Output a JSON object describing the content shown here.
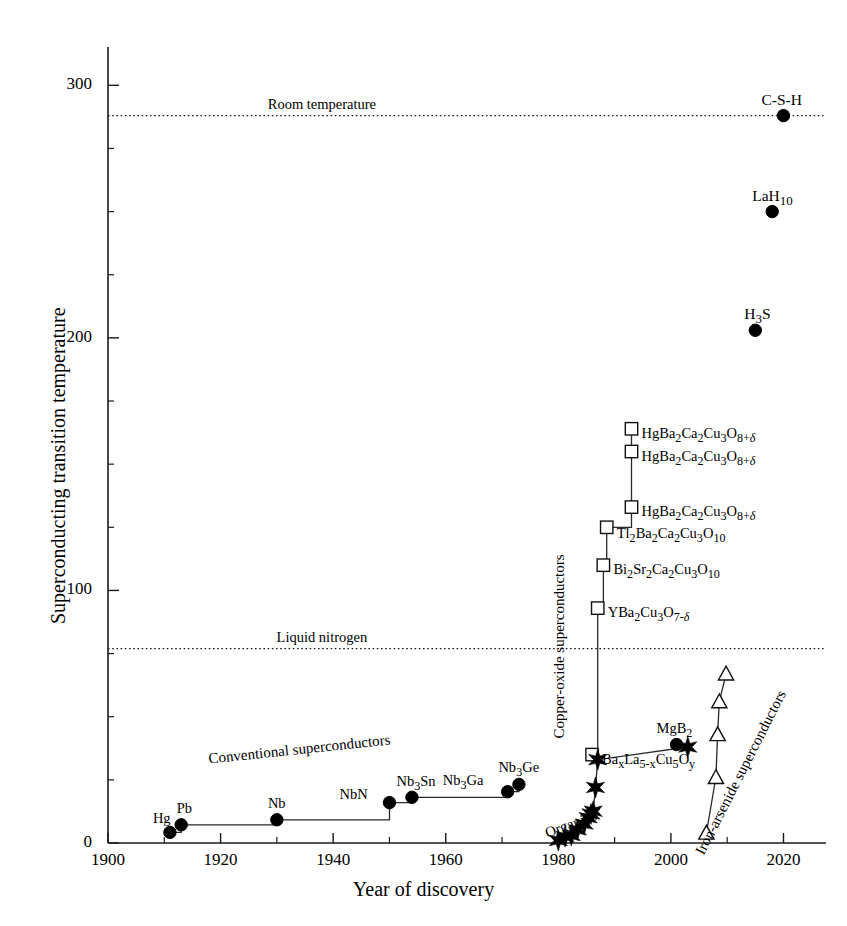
{
  "chart_data": {
    "type": "scatter",
    "title": "",
    "xlabel": "Year of discovery",
    "ylabel": "Superconducting transition temperature",
    "xlim": [
      1900,
      2024
    ],
    "ylim": [
      0,
      312
    ],
    "xticks": [
      1900,
      1920,
      1940,
      1960,
      1980,
      2000,
      2020
    ],
    "xtick_labels": [
      "1900",
      "1920",
      "1940",
      "1960",
      "1980",
      "2000",
      "2020"
    ],
    "xminor_step": 10,
    "yticks": [
      0,
      100,
      200,
      300
    ],
    "ytick_labels": [
      "0",
      "100",
      "200",
      "300"
    ],
    "yminor_step": 25,
    "grid": false,
    "legend": "none",
    "reference_lines": [
      {
        "name": "room-temperature",
        "label": "Room temperature",
        "value": 288,
        "style": "dotted",
        "label_x": 1938
      },
      {
        "name": "liquid-nitrogen",
        "label": "Liquid nitrogen",
        "value": 77,
        "style": "dotted",
        "label_x": 1938
      }
    ],
    "group_labels": [
      {
        "name": "conventional-superconductors",
        "text": "Conventional superconductors",
        "x": 1934,
        "y": 37,
        "rotation": -6
      },
      {
        "name": "copper-oxide-superconductors",
        "text": "Copper-oxide superconductors",
        "x": 1980.2,
        "y": 78,
        "rotation": -90
      },
      {
        "name": "iron-arsenide-superconductors",
        "text": "Iron-arsenide superconductors",
        "x": 2012.5,
        "y": 28,
        "rotation": -63
      },
      {
        "name": "organics",
        "text": "Organics",
        "x": 1982.3,
        "y": 7.5,
        "rotation": -20
      }
    ],
    "series": [
      {
        "name": "conventional",
        "marker": "circle",
        "connected": true,
        "points": [
          {
            "label": "Hg",
            "label_html": "Hg",
            "x": 1911,
            "y": 4.2,
            "lx": -16,
            "ly": -13
          },
          {
            "label": "Pb",
            "label_html": "Pb",
            "x": 1913,
            "y": 7.2,
            "lx": -5,
            "ly": -16
          },
          {
            "label": "Nb",
            "label_html": "Nb",
            "x": 1930,
            "y": 9.2,
            "lx": -8,
            "ly": -16
          },
          {
            "label": "NbN",
            "label_html": "NbN",
            "x": 1950,
            "y": 16.0,
            "lx": -34,
            "ly": -8
          },
          {
            "label": "Nb3Sn",
            "label_html": "Nb<sub>3</sub>Sn",
            "x": 1954,
            "y": 18.1,
            "lx": -4,
            "ly": -15
          },
          {
            "label": "Nb3Ga",
            "label_html": "Nb<sub>3</sub>Ga",
            "x": 1971,
            "y": 20.3,
            "lx": -36,
            "ly": -11
          },
          {
            "label": "Nb3Ge",
            "label_html": "Nb<sub>3</sub>Ge",
            "x": 1973,
            "y": 23.2,
            "lx": -8,
            "ly": -16
          }
        ]
      },
      {
        "name": "cuprates",
        "marker": "square",
        "connected": true,
        "points": [
          {
            "label": "BaLaCuO",
            "label_html": "Ba<sub>x</sub>La<sub>5-x</sub>Cu<sub>5</sub>O<sub>y</sub>",
            "x": 1986,
            "y": 35.0,
            "lx": 10,
            "ly": 5
          },
          {
            "label": "YBa2Cu3O7",
            "label_html": "YBa<sub>2</sub>Cu<sub>3</sub>O<sub>7-<span class='ital'>&delta;</span></sub>",
            "x": 1987,
            "y": 93.0,
            "lx": 10,
            "ly": 5
          },
          {
            "label": "Bi2Sr2Ca2Cu3O10",
            "label_html": "Bi<sub>2</sub>Sr<sub>2</sub>Ca<sub>2</sub>Cu<sub>3</sub>O<sub>10</sub>",
            "x": 1988,
            "y": 110.0,
            "lx": 10,
            "ly": 5
          },
          {
            "label": "Tl2Ba2Ca2Cu3O10",
            "label_html": "Tl<sub>2</sub>Ba<sub>2</sub>Ca<sub>2</sub>Cu<sub>3</sub>O<sub>10</sub>",
            "x": 1988.6,
            "y": 125.0,
            "lx": 10,
            "ly": 7
          },
          {
            "label": "HgBa2Ca2Cu3O8-a",
            "label_html": "HgBa<sub>2</sub>Ca<sub>2</sub>Cu<sub>3</sub>O<sub>8+<span class='ital'>&delta;</span></sub>",
            "x": 1993,
            "y": 133.0,
            "lx": 10,
            "ly": 5
          },
          {
            "label": "HgBa2Ca2Cu3O8-b",
            "label_html": "HgBa<sub>2</sub>Ca<sub>2</sub>Cu<sub>3</sub>O<sub>8+<span class='ital'>&delta;</span></sub>",
            "x": 1993,
            "y": 155.0,
            "lx": 10,
            "ly": 5
          },
          {
            "label": "HgBa2Ca2Cu3O8-c",
            "label_html": "HgBa<sub>2</sub>Ca<sub>2</sub>Cu<sub>3</sub>O<sub>8+<span class='ital'>&delta;</span></sub>",
            "x": 1993,
            "y": 164.0,
            "lx": 10,
            "ly": 5
          }
        ]
      },
      {
        "name": "organics",
        "marker": "star",
        "connected": true,
        "points": [
          {
            "label": "",
            "x": 1980.0,
            "y": 1.0
          },
          {
            "label": "",
            "x": 1981.2,
            "y": 2.5
          },
          {
            "label": "",
            "x": 1982.3,
            "y": 3.0
          },
          {
            "label": "",
            "x": 1983.4,
            "y": 5.2
          },
          {
            "label": "",
            "x": 1984.6,
            "y": 7.5
          },
          {
            "label": "",
            "x": 1985.3,
            "y": 10.0
          },
          {
            "label": "",
            "x": 1985.8,
            "y": 11.5
          },
          {
            "label": "",
            "x": 1986.2,
            "y": 12.6
          },
          {
            "label": "",
            "x": 1986.6,
            "y": 22.0
          },
          {
            "label": "",
            "x": 1987.0,
            "y": 33.0
          },
          {
            "label": "",
            "x": 2003.0,
            "y": 38.0
          }
        ]
      },
      {
        "name": "iron-arsenide",
        "marker": "triangle",
        "connected": true,
        "points": [
          {
            "label": "",
            "x": 2006.3,
            "y": 4.0
          },
          {
            "label": "",
            "x": 2008.0,
            "y": 26.0
          },
          {
            "label": "",
            "x": 2008.3,
            "y": 43.0
          },
          {
            "label": "",
            "x": 2008.6,
            "y": 56.0
          },
          {
            "label": "",
            "x": 2009.8,
            "y": 67.0
          }
        ]
      },
      {
        "name": "mgb2",
        "marker": "circle",
        "connected": false,
        "points": [
          {
            "label": "MgB2",
            "label_html": "MgB<sub>2</sub>",
            "x": 2001,
            "y": 39.0,
            "lx": -10,
            "ly": -16
          }
        ]
      },
      {
        "name": "hydrides",
        "marker": "circle",
        "connected": false,
        "points": [
          {
            "label": "H3S",
            "label_html": "H<sub>3</sub>S",
            "x": 2015,
            "y": 203.0,
            "lx": -6,
            "ly": -16
          },
          {
            "label": "LaH10",
            "label_html": "LaH<sub>10</sub>",
            "x": 2018,
            "y": 250.0,
            "lx": -8,
            "ly": -16
          },
          {
            "label": "C-S-H",
            "label_html": "C-S-H",
            "x": 2020,
            "y": 288.0,
            "lx": -10,
            "ly": -16
          }
        ]
      }
    ]
  }
}
